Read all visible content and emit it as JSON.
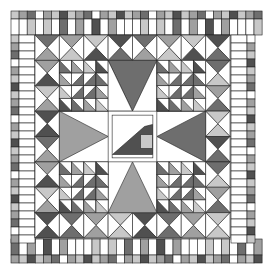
{
  "image": {
    "subject": "quilt-pattern",
    "description": "Square quilt block with brick border, half-square triangle ring, four star blocks and central diamond with small applique"
  },
  "colors": {
    "white": "#ffffff",
    "light": "#c8c8c8",
    "mid": "#a0a0a0",
    "dark": "#6e6e6e",
    "darker": "#505050",
    "line": "#222222"
  },
  "layout": {
    "outer": [
      11,
      11,
      244,
      252
    ],
    "inner": [
      35,
      35,
      195,
      203
    ]
  }
}
